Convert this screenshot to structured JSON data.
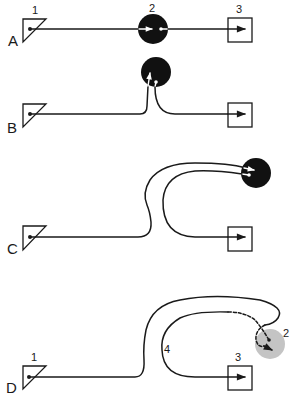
{
  "figure": {
    "colors": {
      "ink": "#1a1a1a",
      "node2_fill": "#111111",
      "node2_fill_faded": "#c4c4c4",
      "background": "#ffffff"
    },
    "panels": [
      {
        "label": "A",
        "node_labels": {
          "source": "1",
          "relay": "2",
          "target": "3"
        },
        "relay_style": "solid-black"
      },
      {
        "label": "B",
        "node_labels": {
          "source": "",
          "relay": "",
          "target": ""
        },
        "relay_style": "solid-black"
      },
      {
        "label": "C",
        "node_labels": {
          "source": "",
          "relay": "",
          "target": ""
        },
        "relay_style": "solid-black"
      },
      {
        "label": "D",
        "node_labels": {
          "source": "1",
          "relay": "2",
          "target": "3",
          "path": "4"
        },
        "relay_style": "faded-gray"
      }
    ]
  }
}
